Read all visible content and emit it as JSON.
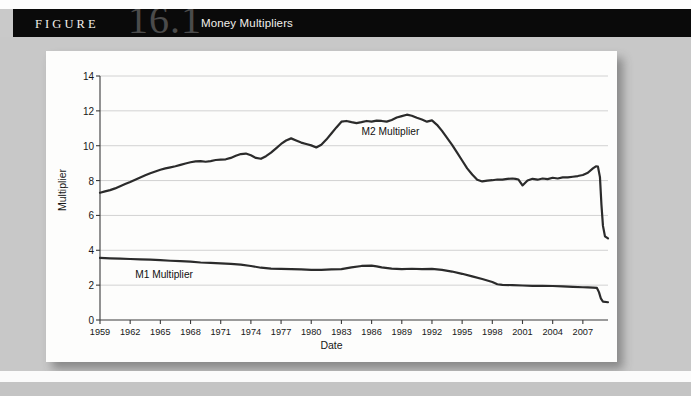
{
  "figure": {
    "label": "FIGURE",
    "number": "16.1",
    "title": "Money Multipliers"
  },
  "chart_data": {
    "type": "line",
    "title": "Money Multipliers",
    "xlabel": "Date",
    "ylabel": "Multiplier",
    "xlim": [
      1959,
      2009.5
    ],
    "ylim": [
      0,
      14
    ],
    "yticks": [
      0,
      2,
      4,
      6,
      8,
      10,
      12,
      14
    ],
    "xticks": [
      1959,
      1962,
      1965,
      1968,
      1971,
      1974,
      1977,
      1980,
      1983,
      1986,
      1989,
      1992,
      1995,
      1998,
      2001,
      2004,
      2007
    ],
    "grid": "horizontal",
    "legend_position": "inline-annotations",
    "annotations": [
      {
        "text": "M2 Multiplier",
        "x": 1985.0,
        "y": 10.8
      },
      {
        "text": "M1 Multiplier",
        "x": 1962.5,
        "y": 2.6
      }
    ],
    "series": [
      {
        "name": "M2 Multiplier",
        "color": "#2b2b2b",
        "x": [
          1959.0,
          1959.5,
          1960.0,
          1960.5,
          1961.0,
          1961.5,
          1962.0,
          1962.5,
          1963.0,
          1963.5,
          1964.0,
          1964.5,
          1965.0,
          1965.5,
          1966.0,
          1966.5,
          1967.0,
          1967.5,
          1968.0,
          1968.5,
          1969.0,
          1969.5,
          1970.0,
          1970.5,
          1971.0,
          1971.5,
          1972.0,
          1972.5,
          1973.0,
          1973.5,
          1974.0,
          1974.5,
          1975.0,
          1975.5,
          1976.0,
          1976.5,
          1977.0,
          1977.5,
          1978.0,
          1978.5,
          1979.0,
          1979.5,
          1980.0,
          1980.5,
          1981.0,
          1981.5,
          1982.0,
          1982.5,
          1983.0,
          1983.5,
          1984.0,
          1984.5,
          1985.0,
          1985.5,
          1986.0,
          1986.5,
          1987.0,
          1987.5,
          1988.0,
          1988.5,
          1989.0,
          1989.5,
          1990.0,
          1990.5,
          1991.0,
          1991.5,
          1992.0,
          1992.5,
          1993.0,
          1993.5,
          1994.0,
          1994.5,
          1995.0,
          1995.5,
          1996.0,
          1996.5,
          1997.0,
          1997.5,
          1998.0,
          1998.5,
          1999.0,
          1999.5,
          2000.0,
          2000.3,
          2000.6,
          2001.0,
          2001.5,
          2002.0,
          2002.5,
          2003.0,
          2003.5,
          2004.0,
          2004.5,
          2005.0,
          2005.5,
          2006.0,
          2006.5,
          2007.0,
          2007.5,
          2008.0,
          2008.3,
          2008.5,
          2008.7,
          2008.85,
          2009.0,
          2009.2,
          2009.5
        ],
        "y": [
          7.3,
          7.38,
          7.45,
          7.55,
          7.68,
          7.8,
          7.92,
          8.05,
          8.18,
          8.3,
          8.42,
          8.52,
          8.62,
          8.7,
          8.76,
          8.82,
          8.9,
          8.98,
          9.05,
          9.1,
          9.12,
          9.08,
          9.12,
          9.18,
          9.2,
          9.22,
          9.3,
          9.42,
          9.52,
          9.55,
          9.45,
          9.3,
          9.25,
          9.4,
          9.6,
          9.85,
          10.1,
          10.3,
          10.42,
          10.3,
          10.18,
          10.1,
          10.02,
          9.9,
          10.05,
          10.35,
          10.7,
          11.05,
          11.38,
          11.42,
          11.35,
          11.3,
          11.35,
          11.42,
          11.38,
          11.44,
          11.42,
          11.38,
          11.48,
          11.62,
          11.7,
          11.78,
          11.72,
          11.6,
          11.5,
          11.38,
          11.45,
          11.2,
          10.85,
          10.45,
          10.05,
          9.6,
          9.15,
          8.7,
          8.35,
          8.05,
          7.95,
          8.0,
          8.02,
          8.06,
          8.05,
          8.1,
          8.12,
          8.1,
          8.06,
          7.72,
          8.0,
          8.1,
          8.05,
          8.12,
          8.08,
          8.16,
          8.12,
          8.18,
          8.18,
          8.22,
          8.26,
          8.32,
          8.45,
          8.7,
          8.82,
          8.8,
          8.2,
          6.6,
          5.4,
          4.8,
          4.68
        ]
      },
      {
        "name": "M1 Multiplier",
        "color": "#2b2b2b",
        "x": [
          1959.0,
          1959.5,
          1960.0,
          1961.0,
          1962.0,
          1963.0,
          1964.0,
          1965.0,
          1966.0,
          1967.0,
          1968.0,
          1969.0,
          1970.0,
          1971.0,
          1972.0,
          1973.0,
          1974.0,
          1975.0,
          1976.0,
          1977.0,
          1978.0,
          1979.0,
          1980.0,
          1981.0,
          1982.0,
          1983.0,
          1984.0,
          1985.0,
          1986.0,
          1986.5,
          1987.0,
          1988.0,
          1989.0,
          1990.0,
          1991.0,
          1992.0,
          1993.0,
          1994.0,
          1995.0,
          1996.0,
          1997.0,
          1998.0,
          1998.5,
          1999.0,
          2000.0,
          2001.0,
          2002.0,
          2003.0,
          2004.0,
          2005.0,
          2006.0,
          2007.0,
          2007.5,
          2008.0,
          2008.4,
          2008.6,
          2008.8,
          2009.0,
          2009.5
        ],
        "y": [
          3.56,
          3.55,
          3.54,
          3.52,
          3.5,
          3.48,
          3.46,
          3.43,
          3.4,
          3.38,
          3.35,
          3.3,
          3.28,
          3.25,
          3.22,
          3.18,
          3.1,
          3.0,
          2.95,
          2.93,
          2.92,
          2.9,
          2.88,
          2.88,
          2.9,
          2.92,
          3.02,
          3.1,
          3.12,
          3.08,
          3.02,
          2.95,
          2.92,
          2.94,
          2.92,
          2.93,
          2.88,
          2.78,
          2.65,
          2.5,
          2.35,
          2.18,
          2.05,
          2.02,
          2.0,
          1.98,
          1.96,
          1.96,
          1.95,
          1.93,
          1.9,
          1.88,
          1.87,
          1.86,
          1.84,
          1.6,
          1.22,
          1.05,
          1.02
        ]
      }
    ]
  }
}
